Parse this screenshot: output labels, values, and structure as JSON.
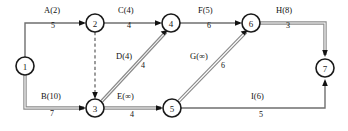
{
  "diagram": {
    "type": "activity-on-arrow-network",
    "title": "",
    "nodes": [
      {
        "id": "1",
        "label": "1",
        "x": 25,
        "y": 66
      },
      {
        "id": "2",
        "label": "2",
        "x": 95,
        "y": 23
      },
      {
        "id": "3",
        "label": "3",
        "x": 95,
        "y": 108
      },
      {
        "id": "4",
        "label": "4",
        "x": 171,
        "y": 23
      },
      {
        "id": "5",
        "label": "5",
        "x": 172,
        "y": 108
      },
      {
        "id": "6",
        "label": "6",
        "x": 251,
        "y": 23
      },
      {
        "id": "7",
        "label": "7",
        "x": 325,
        "y": 68
      }
    ],
    "node_radius": 9,
    "edges": [
      {
        "id": "A",
        "from": "1",
        "to": "2",
        "name": "A(2)",
        "duration": "5",
        "style": "plain",
        "name_x": 44,
        "name_y": 6,
        "dur_x": 50,
        "dur_y": 22
      },
      {
        "id": "B",
        "from": "1",
        "to": "3",
        "name": "B(10)",
        "duration": "7",
        "style": "critical",
        "name_x": 41,
        "name_y": 93,
        "dur_x": 49,
        "dur_y": 110
      },
      {
        "id": "C",
        "from": "2",
        "to": "4",
        "name": "C(4)",
        "duration": "4",
        "style": "plain",
        "name_x": 118,
        "name_y": 6,
        "dur_x": 126,
        "dur_y": 22
      },
      {
        "id": "D",
        "from": "3",
        "to": "4",
        "name": "D(4)",
        "duration": "4",
        "style": "critical",
        "name_x": 116,
        "name_y": 52,
        "dur_x": 141,
        "dur_y": 62
      },
      {
        "id": "E",
        "from": "3",
        "to": "5",
        "name": "E(∞)",
        "duration": "4",
        "style": "critical",
        "name_x": 118,
        "name_y": 93,
        "dur_x": 129,
        "dur_y": 112
      },
      {
        "id": "F",
        "from": "4",
        "to": "6",
        "name": "F(5)",
        "duration": "6",
        "style": "plain",
        "name_x": 198,
        "name_y": 6,
        "dur_x": 206,
        "dur_y": 22
      },
      {
        "id": "G",
        "from": "5",
        "to": "6",
        "name": "G(∞)",
        "duration": "6",
        "style": "critical",
        "name_x": 190,
        "name_y": 52,
        "dur_x": 220,
        "dur_y": 62
      },
      {
        "id": "H",
        "from": "6",
        "to": "7",
        "name": "H(8)",
        "duration": "3",
        "style": "critical",
        "name_x": 276,
        "name_y": 6,
        "dur_x": 285,
        "dur_y": 22
      },
      {
        "id": "I",
        "from": "5",
        "to": "7",
        "name": "I(6)",
        "duration": "5",
        "style": "plain",
        "name_x": 251,
        "name_y": 93,
        "dur_x": 258,
        "dur_y": 111
      },
      {
        "id": "dummy-2-3",
        "from": "2",
        "to": "3",
        "name": "",
        "duration": "",
        "style": "dashed",
        "name_x": 0,
        "name_y": 0,
        "dur_x": 0,
        "dur_y": 0
      }
    ],
    "colors": {
      "node_stroke": "#1a1a1a",
      "edge_plain": "#6f6f6f",
      "edge_critical": "#8a8a8a",
      "arrowhead": "#121212",
      "text": "#111111",
      "background": "#ffffff"
    }
  }
}
